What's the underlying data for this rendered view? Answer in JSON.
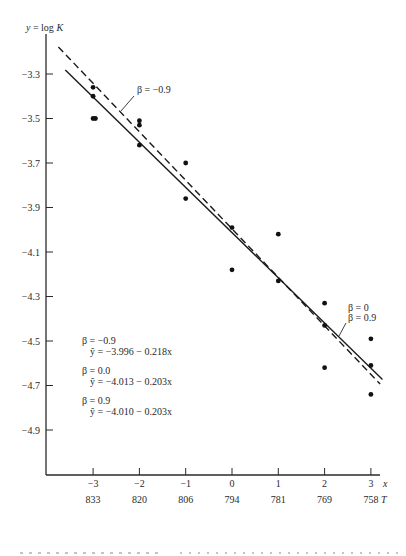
{
  "chart_data": {
    "type": "scatter",
    "title": "",
    "ylabel": "y = log K",
    "xlabel": "x",
    "x2label": "T",
    "xlim": [
      -3.8,
      3.2
    ],
    "ylim": [
      -5.1,
      -3.08
    ],
    "grid": false,
    "yticks": [
      -3.3,
      -3.5,
      -3.7,
      -3.9,
      -4.1,
      -4.3,
      -4.5,
      -4.7,
      -4.9
    ],
    "ytick_labels": [
      "−3.3",
      "−3.5",
      "−3.7",
      "−3.9",
      "−4.1",
      "−4.3",
      "−4.5",
      "−4.7",
      "−4.9"
    ],
    "xticks": [
      -3,
      -2,
      -1,
      0,
      1,
      2,
      3
    ],
    "xtick_labels": [
      "−3",
      "−2",
      "−1",
      "0",
      "1",
      "2",
      "3"
    ],
    "x2tick_labels": [
      "833",
      "820",
      "806",
      "794",
      "781",
      "769",
      "758"
    ],
    "points": [
      {
        "x": -3,
        "y": -3.36
      },
      {
        "x": -3,
        "y": -3.4
      },
      {
        "x": -3,
        "y": -3.5
      },
      {
        "x": -2.95,
        "y": -3.5
      },
      {
        "x": -2,
        "y": -3.51
      },
      {
        "x": -2,
        "y": -3.53
      },
      {
        "x": -2,
        "y": -3.62
      },
      {
        "x": -1,
        "y": -3.7
      },
      {
        "x": -1,
        "y": -3.86
      },
      {
        "x": 0,
        "y": -3.99
      },
      {
        "x": 0,
        "y": -4.18
      },
      {
        "x": 1,
        "y": -4.02
      },
      {
        "x": 1,
        "y": -4.23
      },
      {
        "x": 2,
        "y": -4.33
      },
      {
        "x": 2,
        "y": -4.43
      },
      {
        "x": 2,
        "y": -4.62
      },
      {
        "x": 3,
        "y": -4.49
      },
      {
        "x": 3,
        "y": -4.61
      },
      {
        "x": 3,
        "y": -4.74
      }
    ],
    "series": [
      {
        "name": "β = −0.9",
        "style": "dashed",
        "intercept": -3.996,
        "slope": -0.218,
        "x_range": [
          -3.75,
          3.2
        ]
      },
      {
        "name": "β = 0",
        "style": "solid",
        "intercept": -4.013,
        "slope": -0.203,
        "x_range": [
          -3.6,
          3.25
        ]
      }
    ],
    "annotations": {
      "dashed_label": "β = −0.9",
      "solid_label_1": "β = 0",
      "solid_label_2": "β = 0.9"
    },
    "legend": [
      {
        "beta": "β = −0.9",
        "equation": "ŷ = −3.996 − 0.218x"
      },
      {
        "beta": "β = 0.0",
        "equation": "ŷ = −4.013 − 0.203x"
      },
      {
        "beta": "β = 0.9",
        "equation": "ŷ = −4.010 − 0.203x"
      }
    ],
    "legend_position": "bottom-left"
  },
  "caption_fragment": "Fig. ... showing points and fitted lines for β = −0.9, 0.0, 0.9"
}
